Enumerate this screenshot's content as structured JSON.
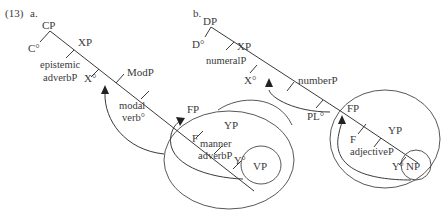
{
  "example": {
    "number": "(13)",
    "panels": [
      {
        "letter": "a.",
        "nodes": {
          "root": "CP",
          "root_head": "C°",
          "xp": "XP",
          "spec_xp_line1": "epistemic",
          "spec_xp_line2": "adverbP",
          "x_head": "X°",
          "modp": "ModP",
          "mod_head_line1": "modal",
          "mod_head_line2": "verb°",
          "fp": "FP",
          "f_head": "F",
          "yp": "YP",
          "spec_yp_line1": "manner",
          "spec_yp_line2": "adverbP",
          "y_head": "Y°",
          "complement": "VP"
        }
      },
      {
        "letter": "b.",
        "nodes": {
          "root": "DP",
          "root_head": "D°",
          "xp": "XP",
          "spec_xp": "numeralP",
          "x_head": "X°",
          "numberp": "numberP",
          "pl_head": "PL°",
          "fp": "FP",
          "f_head": "F",
          "yp": "YP",
          "spec_yp": "adjectiveP",
          "y_head": "Y°",
          "complement": "NP"
        }
      }
    ]
  },
  "colors": {
    "line": "#3a3a3a",
    "text": "#3a3a3a",
    "background": "#ffffff"
  }
}
